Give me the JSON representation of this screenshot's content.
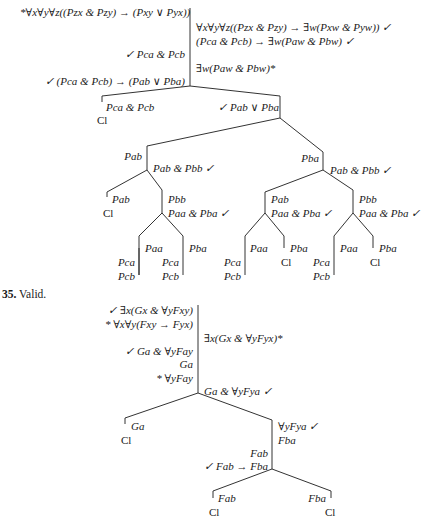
{
  "tree34": {
    "premise_left": "*∀x∀y∀z((Pzx & Pzy) → (Pxy ∨ Pyx))",
    "right_1": "∀x∀y∀z((Pzx & Pzy) → ∃w(Pxw & Pyw))  ✓",
    "right_2": "(Pca & Pcb) → ∃w(Paw & Pbw)  ✓",
    "left_1": "✓  Pca & Pcb",
    "right_3": "∃w(Paw & Pbw)*",
    "left_2": "✓  (Pca & Pcb) → (Pab ∨ Pba)",
    "branch_L": "Pca & Pcb",
    "branch_L_close": "Cl",
    "branch_R": "✓  Pab ∨ Pba",
    "pab": "Pab",
    "pab_conj": "Pab & Pbb  ✓",
    "pba": "Pba",
    "pba_conj": "Pab & Pbb  ✓",
    "n1_pab": "Pab",
    "n1_close": "Cl",
    "n1_pbb": "Pbb",
    "n1_conj": "Paa & Pba  ✓",
    "n1_paa": "Paa",
    "n1_pba": "Pba",
    "n1_pca_l": "Pca",
    "n1_pcb_l": "Pcb",
    "n1_pca_m": "Pca",
    "n1_pcb_m": "Pcb",
    "n2_pab": "Pab",
    "n2_conj": "Paa & Pba  ✓",
    "n2_pbb": "Pbb",
    "n2_conj2": "Paa & Pba  ✓",
    "n2_paa": "Paa",
    "n2_pba": "Pba",
    "n2_close": "Cl",
    "n2_pca": "Pca",
    "n2_pcb": "Pcb",
    "n3_paa": "Paa",
    "n3_pba": "Pba",
    "n3_close": "Cl",
    "n3_pca": "Pca",
    "n3_pcb": "Pcb"
  },
  "problem35": {
    "number": "35.",
    "verdict": "Valid.",
    "left_1": "✓  ∃x(Gx & ∀yFxy)",
    "left_2": "* ∀x∀y(Fxy → Fyx)",
    "right_1": "∃x(Gx & ∀yFyx)*",
    "left_3": "✓  Ga & ∀yFay",
    "left_4": "Ga",
    "left_5": "* ∀yFay",
    "right_2": "Ga & ∀yFya  ✓",
    "branch_L": "Ga",
    "branch_L_close": "Cl",
    "branch_R_1": "∀yFya  ✓",
    "branch_R_2": "Fba",
    "mid_1": "Fab",
    "mid_2": "✓  Fab → Fba",
    "leaf_L": "Fab",
    "leaf_L_close": "Cl",
    "leaf_R": "Fba",
    "leaf_R_close": "Cl"
  }
}
